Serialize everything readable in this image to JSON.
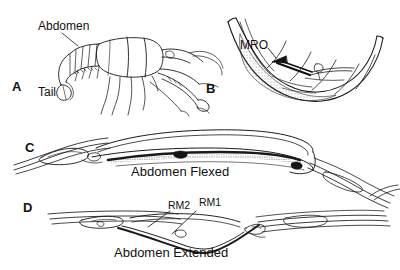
{
  "figure": {
    "background": "#ffffff",
    "ink": "#111111",
    "width": 400,
    "height": 270
  },
  "panels": [
    {
      "id": "A",
      "letter": "A",
      "subject": "crayfish-lateral-view",
      "labels": [
        {
          "name": "abdomen-label",
          "text": "Abdomen"
        },
        {
          "name": "tail-label",
          "text": "Tail"
        }
      ]
    },
    {
      "id": "B",
      "letter": "B",
      "subject": "flexed-abdomen-cutaway",
      "labels": [
        {
          "name": "mro-label",
          "text": "MRO"
        }
      ]
    },
    {
      "id": "C",
      "letter": "C",
      "subject": "abdomen-segments-flexed",
      "caption": "Abdomen Flexed",
      "labels": []
    },
    {
      "id": "D",
      "letter": "D",
      "subject": "abdomen-segments-extended",
      "caption": "Abdomen Extended",
      "labels": [
        {
          "name": "rm2-label",
          "text": "RM2"
        },
        {
          "name": "rm1-label",
          "text": "RM1"
        }
      ]
    }
  ],
  "panel_a": {
    "letter": "A",
    "abdomen_label": "Abdomen",
    "tail_label": "Tail"
  },
  "panel_b": {
    "letter": "B",
    "mro_label": "MRO"
  },
  "panel_c": {
    "letter": "C",
    "caption": "Abdomen Flexed"
  },
  "panel_d": {
    "letter": "D",
    "caption": "Abdomen Extended",
    "rm2_label": "RM2",
    "rm1_label": "RM1"
  }
}
